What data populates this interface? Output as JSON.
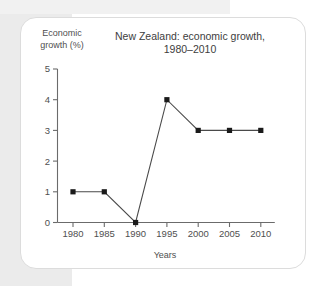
{
  "card": {
    "name": "chart-card"
  },
  "chart_data": {
    "type": "line",
    "title": "New Zealand: economic growth,",
    "title_line2": "1980–2010",
    "title_full": "New Zealand: economic growth, 1980–2010",
    "xlabel": "Years",
    "ylabel": "Economic growth (%)",
    "ylabel_line1": "Economic",
    "ylabel_line2": "growth (%)",
    "categories": [
      "1980",
      "1985",
      "1990",
      "1995",
      "2000",
      "2005",
      "2010"
    ],
    "values": [
      1,
      1,
      0,
      4,
      3,
      3,
      3
    ],
    "x": [
      1980,
      1985,
      1990,
      1995,
      2000,
      2005,
      2010
    ],
    "ylim": [
      0,
      5
    ],
    "xlim": [
      1980,
      2010
    ],
    "ytick_labels": [
      "0",
      "1",
      "2",
      "3",
      "4",
      "5"
    ],
    "yticks": [
      0,
      1,
      2,
      3,
      4,
      5
    ],
    "grid": false,
    "legend": false,
    "marker": "square",
    "line_color": "#4a4a4a",
    "marker_color": "#1a1a1a",
    "axis_color": "#6b6b6b"
  }
}
